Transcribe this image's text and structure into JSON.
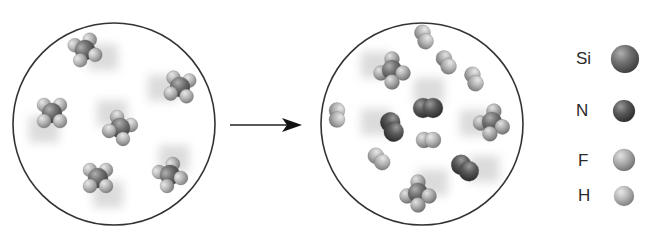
{
  "diagram": {
    "type": "reaction-particle-diagram",
    "reactants_panel": {
      "label": "reactants",
      "molecules": [
        {
          "formula": "SiH4",
          "x": 85,
          "y": 50,
          "angle": -20,
          "blur_dir": 20
        },
        {
          "formula": "SiH4",
          "x": 180,
          "y": 87,
          "angle": 10,
          "blur_dir": 180
        },
        {
          "formula": "SiH4",
          "x": 52,
          "y": 113,
          "angle": 0,
          "blur_dir": 120
        },
        {
          "formula": "SiH4",
          "x": 120,
          "y": 128,
          "angle": 30,
          "blur_dir": 240
        },
        {
          "formula": "SiH4",
          "x": 98,
          "y": 178,
          "angle": 0,
          "blur_dir": 60
        },
        {
          "formula": "SiH4",
          "x": 170,
          "y": 175,
          "angle": -30,
          "blur_dir": 280
        }
      ]
    },
    "arrow": {
      "from_x": 230,
      "to_x": 302,
      "y": 125
    },
    "products_panel": {
      "label": "products",
      "molecules": [
        {
          "formula": "SiF4",
          "x": 392,
          "y": 70,
          "angle": 0,
          "blur_dir": 200
        },
        {
          "formula": "H2",
          "x": 424,
          "y": 37,
          "angle": 70
        },
        {
          "formula": "HF",
          "x": 446,
          "y": 62,
          "angle": 60
        },
        {
          "formula": "H2",
          "x": 474,
          "y": 79,
          "angle": 70
        },
        {
          "formula": "H2",
          "x": 337,
          "y": 115,
          "angle": 90
        },
        {
          "formula": "N2",
          "x": 428,
          "y": 108,
          "angle": 0,
          "blur_dir": 270
        },
        {
          "formula": "SiF4",
          "x": 492,
          "y": 122,
          "angle": 10,
          "blur_dir": 180
        },
        {
          "formula": "N2",
          "x": 392,
          "y": 127,
          "angle": 70,
          "blur_dir": 200
        },
        {
          "formula": "HF",
          "x": 428,
          "y": 140,
          "angle": 0
        },
        {
          "formula": "H2",
          "x": 379,
          "y": 159,
          "angle": 45
        },
        {
          "formula": "N2",
          "x": 465,
          "y": 168,
          "angle": 40,
          "blur_dir": 0
        },
        {
          "formula": "SiF4",
          "x": 418,
          "y": 193,
          "angle": 0,
          "blur_dir": 320
        }
      ]
    },
    "legend": [
      {
        "symbol": "Si",
        "name": "silicon",
        "color": "#6e6e6e",
        "radius": 14,
        "label_x": 576,
        "label_y": 50,
        "sphere_x": 625,
        "sphere_y": 59
      },
      {
        "symbol": "N",
        "name": "nitrogen",
        "color": "#5a5a5a",
        "radius": 11,
        "label_x": 576,
        "label_y": 102,
        "sphere_x": 624,
        "sphere_y": 111
      },
      {
        "symbol": "F",
        "name": "fluorine",
        "color": "#a8a8a8",
        "radius": 11,
        "label_x": 578,
        "label_y": 152,
        "sphere_x": 624,
        "sphere_y": 160
      },
      {
        "symbol": "H",
        "name": "hydrogen",
        "color": "#b4b4b4",
        "radius": 10,
        "label_x": 578,
        "label_y": 187,
        "sphere_x": 624,
        "sphere_y": 196
      }
    ],
    "circles": [
      {
        "cx": 114,
        "cy": 124,
        "r": 101
      },
      {
        "cx": 422,
        "cy": 124,
        "r": 101
      }
    ]
  }
}
